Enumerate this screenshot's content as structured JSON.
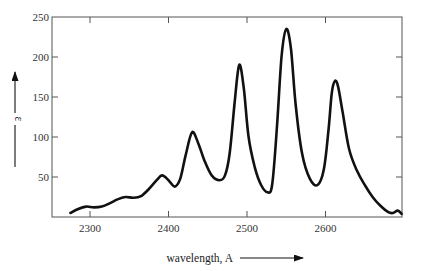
{
  "chart_data": {
    "type": "line",
    "title": "",
    "xlabel": "wavelength, A",
    "ylabel": "ε",
    "xlim": [
      2255,
      2700
    ],
    "ylim": [
      0,
      250
    ],
    "x_ticks": [
      2300,
      2400,
      2500,
      2600
    ],
    "y_ticks": [
      50,
      100,
      150,
      200,
      250
    ],
    "grid": false,
    "legend": null,
    "series": [
      {
        "name": "absorption spectrum",
        "color": "#111111",
        "x": [
          2275,
          2285,
          2295,
          2305,
          2315,
          2325,
          2335,
          2345,
          2355,
          2365,
          2375,
          2385,
          2392,
          2400,
          2408,
          2415,
          2422,
          2430,
          2438,
          2446,
          2455,
          2465,
          2472,
          2478,
          2484,
          2490,
          2496,
          2502,
          2510,
          2518,
          2526,
          2532,
          2538,
          2544,
          2550,
          2556,
          2562,
          2570,
          2580,
          2590,
          2598,
          2604,
          2608,
          2612,
          2616,
          2622,
          2630,
          2640,
          2650,
          2660,
          2670,
          2680,
          2686,
          2692,
          2697
        ],
        "y": [
          5,
          10,
          13,
          12,
          13,
          17,
          22,
          25,
          24,
          26,
          35,
          46,
          52,
          46,
          38,
          48,
          78,
          106,
          92,
          70,
          52,
          46,
          52,
          80,
          140,
          190,
          160,
          100,
          62,
          40,
          31,
          40,
          110,
          200,
          235,
          210,
          140,
          80,
          48,
          40,
          60,
          110,
          155,
          170,
          163,
          130,
          85,
          58,
          40,
          25,
          14,
          6,
          5,
          8,
          4
        ]
      }
    ]
  },
  "axes": {
    "x_tick_labels": [
      "2300",
      "2400",
      "2500",
      "2600"
    ],
    "y_tick_labels": [
      "250",
      "200",
      "150",
      "100",
      "50"
    ],
    "x_axis_title": "wavelength, A",
    "y_axis_title": "ε"
  }
}
